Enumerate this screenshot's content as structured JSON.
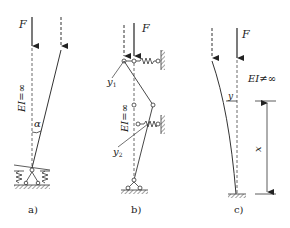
{
  "figure": {
    "panels": [
      {
        "id": "a",
        "caption": "a)",
        "force_label": "F",
        "stiffness_label": "EI=∞",
        "angle_label": "α"
      },
      {
        "id": "b",
        "caption": "b)",
        "force_label": "F",
        "stiffness_label": "EI=∞",
        "displacement_labels": [
          "y",
          "y"
        ],
        "displacement_subscripts": [
          "1",
          "2"
        ]
      },
      {
        "id": "c",
        "caption": "c)",
        "force_label": "F",
        "stiffness_label": "EI≠∞",
        "deflection_label": "y",
        "coordinate_label": "x"
      }
    ]
  },
  "colors": {
    "line": "#333333",
    "hatch": "#555555",
    "background": "#ffffff"
  }
}
